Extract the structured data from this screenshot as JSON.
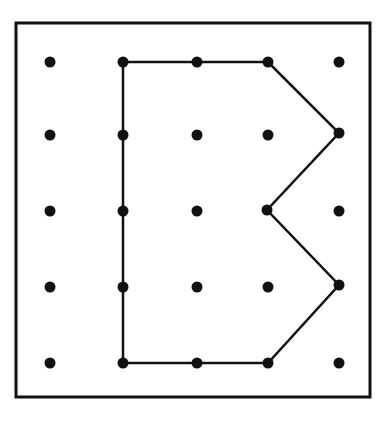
{
  "figure": {
    "background_color": "#ffffff",
    "ink_color": "#111111"
  },
  "frame": {
    "name": "board-border",
    "x": 16,
    "y": 23,
    "width": 354,
    "height": 374,
    "stroke_width": 3,
    "stroke_color": "#111111",
    "fill_color": "#ffffff"
  },
  "grid": {
    "rows": 5,
    "columns": 5,
    "column_x": [
      50,
      123,
      197,
      268,
      339
    ],
    "row_y": [
      62,
      135,
      211,
      287,
      363
    ],
    "peg_radius": 5.5,
    "peg_color": "#111111",
    "labels": {
      "columns": [
        "c1",
        "c2",
        "c3",
        "c4",
        "c5"
      ],
      "rows": [
        "r1",
        "r2",
        "r3",
        "r4",
        "r5"
      ]
    },
    "pegs": [
      {
        "id": "peg-r1c1",
        "col": 1,
        "row": 1,
        "x": 50,
        "y": 62,
        "on_band": false
      },
      {
        "id": "peg-r1c2",
        "col": 2,
        "row": 1,
        "x": 123,
        "y": 62,
        "on_band": true
      },
      {
        "id": "peg-r1c3",
        "col": 3,
        "row": 1,
        "x": 197,
        "y": 62,
        "on_band": true
      },
      {
        "id": "peg-r1c4",
        "col": 4,
        "row": 1,
        "x": 268,
        "y": 62,
        "on_band": true
      },
      {
        "id": "peg-r1c5",
        "col": 5,
        "row": 1,
        "x": 339,
        "y": 62,
        "on_band": false
      },
      {
        "id": "peg-r2c1",
        "col": 1,
        "row": 2,
        "x": 50,
        "y": 135,
        "on_band": false
      },
      {
        "id": "peg-r2c2",
        "col": 2,
        "row": 2,
        "x": 123,
        "y": 135,
        "on_band": true
      },
      {
        "id": "peg-r2c3",
        "col": 3,
        "row": 2,
        "x": 197,
        "y": 135,
        "on_band": false
      },
      {
        "id": "peg-r2c4",
        "col": 4,
        "row": 2,
        "x": 268,
        "y": 135,
        "on_band": false
      },
      {
        "id": "peg-r2c5",
        "col": 5,
        "row": 2,
        "x": 339,
        "y": 133,
        "on_band": true
      },
      {
        "id": "peg-r3c1",
        "col": 1,
        "row": 3,
        "x": 50,
        "y": 211,
        "on_band": false
      },
      {
        "id": "peg-r3c2",
        "col": 2,
        "row": 3,
        "x": 123,
        "y": 211,
        "on_band": true
      },
      {
        "id": "peg-r3c3",
        "col": 3,
        "row": 3,
        "x": 197,
        "y": 211,
        "on_band": false
      },
      {
        "id": "peg-r3c4",
        "col": 4,
        "row": 3,
        "x": 267,
        "y": 210,
        "on_band": true
      },
      {
        "id": "peg-r3c5",
        "col": 5,
        "row": 3,
        "x": 339,
        "y": 211,
        "on_band": false
      },
      {
        "id": "peg-r4c1",
        "col": 1,
        "row": 4,
        "x": 50,
        "y": 287,
        "on_band": false
      },
      {
        "id": "peg-r4c2",
        "col": 2,
        "row": 4,
        "x": 123,
        "y": 287,
        "on_band": true
      },
      {
        "id": "peg-r4c3",
        "col": 3,
        "row": 4,
        "x": 197,
        "y": 287,
        "on_band": false
      },
      {
        "id": "peg-r4c4",
        "col": 4,
        "row": 4,
        "x": 268,
        "y": 287,
        "on_band": false
      },
      {
        "id": "peg-r4c5",
        "col": 5,
        "row": 4,
        "x": 339,
        "y": 285,
        "on_band": true
      },
      {
        "id": "peg-r5c1",
        "col": 1,
        "row": 5,
        "x": 50,
        "y": 363,
        "on_band": false
      },
      {
        "id": "peg-r5c2",
        "col": 2,
        "row": 5,
        "x": 123,
        "y": 363,
        "on_band": true
      },
      {
        "id": "peg-r5c3",
        "col": 3,
        "row": 5,
        "x": 197,
        "y": 363,
        "on_band": true
      },
      {
        "id": "peg-r5c4",
        "col": 4,
        "row": 5,
        "x": 268,
        "y": 363,
        "on_band": true
      },
      {
        "id": "peg-r5c5",
        "col": 5,
        "row": 5,
        "x": 339,
        "y": 363,
        "on_band": false
      }
    ]
  },
  "band": {
    "name": "elastic-band-polygon",
    "closed": true,
    "stroke_width": 2.5,
    "stroke_color": "#111111",
    "fill": "none",
    "vertex_count": 7,
    "vertices": [
      {
        "peg": "peg-r1c2",
        "col": 2,
        "row": 1,
        "x": 123,
        "y": 62
      },
      {
        "peg": "peg-r1c4",
        "col": 4,
        "row": 1,
        "x": 268,
        "y": 62
      },
      {
        "peg": "peg-r2c5",
        "col": 5,
        "row": 2,
        "x": 339,
        "y": 133
      },
      {
        "peg": "peg-r3c4",
        "col": 4,
        "row": 3,
        "x": 267,
        "y": 210
      },
      {
        "peg": "peg-r4c5",
        "col": 5,
        "row": 4,
        "x": 339,
        "y": 285
      },
      {
        "peg": "peg-r5c4",
        "col": 4,
        "row": 5,
        "x": 268,
        "y": 363
      },
      {
        "peg": "peg-r5c2",
        "col": 2,
        "row": 5,
        "x": 123,
        "y": 363
      }
    ],
    "path_d": "M 123 62 L 268 62 L 339 133 L 267 210 L 339 285 L 268 363 L 123 363 Z"
  }
}
